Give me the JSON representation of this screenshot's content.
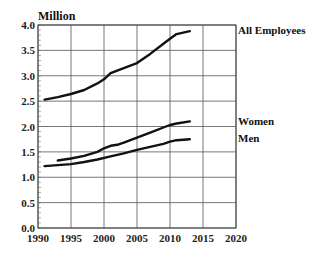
{
  "chart_data": {
    "type": "line",
    "title": "",
    "xlabel": "",
    "ylabel": "Million",
    "xlim": [
      1990,
      2020
    ],
    "ylim": [
      0.0,
      4.0
    ],
    "grid": true,
    "legend_position": "right (direct labels at line ends)",
    "x_ticks": [
      "1990",
      "1995",
      "2000",
      "2005",
      "2010",
      "2015",
      "2020"
    ],
    "y_ticks": [
      "0.0",
      "0.5",
      "1.0",
      "1.5",
      "2.0",
      "2.5",
      "3.0",
      "3.5",
      "4.0"
    ],
    "series": [
      {
        "name": "All Employees",
        "x": [
          1991,
          1993,
          1995,
          1997,
          1999,
          2000,
          2001,
          2003,
          2005,
          2007,
          2009,
          2010,
          2011,
          2013
        ],
        "values": [
          2.53,
          2.58,
          2.64,
          2.72,
          2.85,
          2.93,
          3.05,
          3.15,
          3.25,
          3.43,
          3.63,
          3.73,
          3.82,
          3.88
        ]
      },
      {
        "name": "Women",
        "x": [
          1993,
          1995,
          1997,
          1999,
          2000,
          2001,
          2002,
          2003,
          2005,
          2007,
          2009,
          2010,
          2011,
          2013
        ],
        "values": [
          1.33,
          1.37,
          1.42,
          1.5,
          1.57,
          1.62,
          1.64,
          1.68,
          1.78,
          1.88,
          1.98,
          2.03,
          2.06,
          2.1
        ]
      },
      {
        "name": "Men",
        "x": [
          1991,
          1993,
          1995,
          1997,
          1999,
          2001,
          2003,
          2005,
          2007,
          2009,
          2010,
          2011,
          2013
        ],
        "values": [
          1.22,
          1.24,
          1.26,
          1.3,
          1.35,
          1.41,
          1.47,
          1.54,
          1.6,
          1.66,
          1.7,
          1.73,
          1.75
        ]
      }
    ]
  }
}
